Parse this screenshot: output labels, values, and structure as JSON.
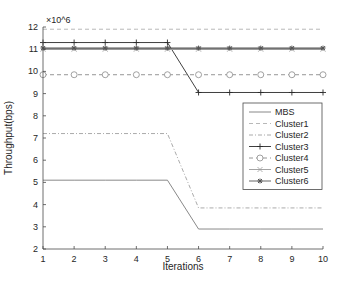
{
  "chart_data": {
    "type": "line",
    "title": "",
    "xlabel": "Iterations",
    "ylabel": "Throughput(bps)",
    "y_exponent": "×10^6",
    "xlim": [
      1,
      10
    ],
    "ylim": [
      2,
      12
    ],
    "x": [
      1,
      2,
      3,
      4,
      5,
      6,
      7,
      8,
      9,
      10
    ],
    "x_ticks": [
      "1",
      "2",
      "3",
      "4",
      "5",
      "6",
      "7",
      "8",
      "9",
      "10"
    ],
    "y_ticks": [
      "2",
      "3",
      "4",
      "5",
      "6",
      "7",
      "8",
      "9",
      "10",
      "11",
      "12"
    ],
    "grid": false,
    "legend_position": "inside right",
    "series": [
      {
        "name": "MBS",
        "style": "solid",
        "marker": "none",
        "color": "#7a7a7a",
        "values": [
          5.1,
          5.1,
          5.1,
          5.1,
          5.1,
          2.9,
          2.9,
          2.9,
          2.9,
          2.9
        ]
      },
      {
        "name": "Cluster1",
        "style": "dashed",
        "marker": "none",
        "color": "#b0b0b0",
        "values": [
          11.9,
          11.9,
          11.9,
          11.9,
          11.9,
          11.9,
          11.9,
          11.9,
          11.9,
          11.9
        ]
      },
      {
        "name": "Cluster2",
        "style": "dashdot",
        "marker": "none",
        "color": "#a0a0a0",
        "values": [
          7.2,
          7.2,
          7.2,
          7.2,
          7.2,
          3.85,
          3.85,
          3.85,
          3.85,
          3.85
        ]
      },
      {
        "name": "Cluster3",
        "style": "solid",
        "marker": "plus",
        "color": "#2a2a2a",
        "values": [
          11.3,
          11.3,
          11.3,
          11.3,
          11.3,
          9.05,
          9.05,
          9.05,
          9.05,
          9.05
        ]
      },
      {
        "name": "Cluster4",
        "style": "dashed",
        "marker": "circle",
        "color": "#8a8a8a",
        "values": [
          9.85,
          9.85,
          9.85,
          9.85,
          9.85,
          9.85,
          9.85,
          9.85,
          9.85,
          9.85
        ]
      },
      {
        "name": "Cluster5",
        "style": "solid",
        "marker": "x",
        "color": "#9a9a9a",
        "values": [
          11.0,
          11.0,
          11.0,
          11.0,
          11.0,
          11.0,
          11.0,
          11.0,
          11.0,
          11.0
        ]
      },
      {
        "name": "Cluster6",
        "style": "solid",
        "marker": "star",
        "color": "#555555",
        "values": [
          11.05,
          11.05,
          11.05,
          11.05,
          11.05,
          11.05,
          11.05,
          11.05,
          11.05,
          11.05
        ]
      }
    ]
  }
}
